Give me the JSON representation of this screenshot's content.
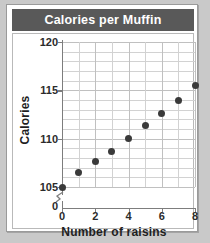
{
  "title": "Calories per Muffin",
  "chart_data": {
    "type": "scatter",
    "title": "Calories per Muffin",
    "xlabel": "Number of raisins",
    "ylabel": "Calories",
    "x": [
      0,
      1,
      2,
      3,
      4,
      5,
      6,
      7,
      8
    ],
    "values": [
      105,
      106.5,
      107.6,
      108.7,
      110,
      111.4,
      112.6,
      114,
      115.5
    ],
    "xlim": [
      0,
      8
    ],
    "ylim": [
      105,
      120
    ],
    "xticks": [
      "0",
      "2",
      "4",
      "6",
      "8"
    ],
    "xtick_values": [
      0,
      2,
      4,
      6,
      8
    ],
    "yticks": [
      "105",
      "110",
      "115",
      "120"
    ],
    "ytick_values": [
      105,
      110,
      115,
      120
    ],
    "y_origin_label": "0",
    "grid": true,
    "grid_step_x": 1,
    "grid_step_y": 1,
    "axis_break": true,
    "legend": null,
    "colors": {
      "marker": "#3a3a3a",
      "grid": "#d2d2d2",
      "axis": "#7d7d7d",
      "title_band": "#595959",
      "title_text": "#ffffff",
      "card": "#ffffff",
      "page_background": "#c9c9c9"
    }
  }
}
